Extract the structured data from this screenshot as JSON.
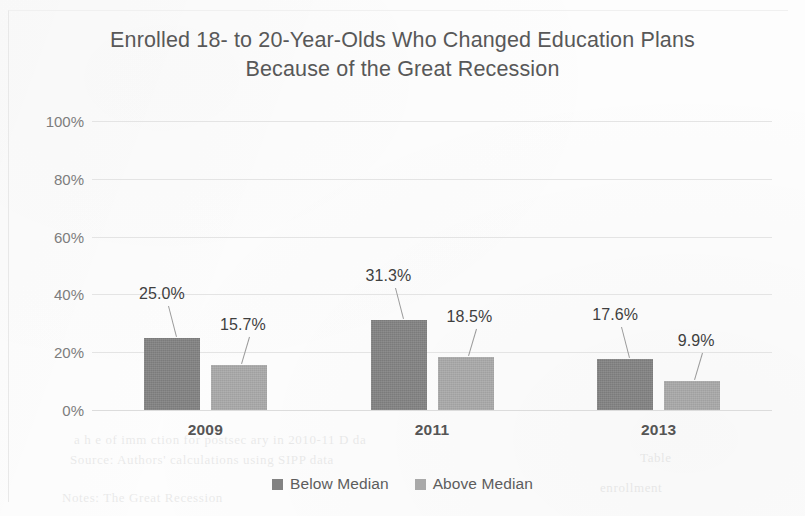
{
  "chart_data": {
    "type": "bar",
    "title": "Enrolled 18- to 20-Year-Olds Who Changed Education Plans Because of the Great Recession",
    "title_line1": "Enrolled 18- to 20-Year-Olds Who Changed Education Plans",
    "title_line2": "Because of the Great Recession",
    "xlabel": "",
    "ylabel": "",
    "categories": [
      "2009",
      "2011",
      "2013"
    ],
    "series": [
      {
        "name": "Below Median",
        "color": "#828282",
        "values": [
          25.0,
          31.3,
          17.6
        ],
        "labels": [
          "25.0%",
          "31.3%",
          "17.6%"
        ]
      },
      {
        "name": "Above Median",
        "color": "#a9a9a9",
        "values": [
          15.7,
          18.5,
          9.9
        ],
        "labels": [
          "15.7%",
          "18.5%",
          "9.9%"
        ]
      }
    ],
    "ylim": [
      0,
      100
    ],
    "ytick_values": [
      0,
      20,
      40,
      60,
      80,
      100
    ],
    "ytick_labels": [
      "0%",
      "20%",
      "40%",
      "60%",
      "80%",
      "100%"
    ],
    "grid": true,
    "grid_color": "#e4e4e4",
    "legend_position": "bottom-center",
    "data_labels_shown": true,
    "data_label_style": "callout-with-leader-line"
  },
  "background_ghost_text": [
    {
      "text": "a  h  e  of  imm  ction  for  postsec  ary  in  2010-11  D  da",
      "x": 74,
      "y": 432,
      "size": 13
    },
    {
      "text": "Source:  Authors'  calculations  using  SIPP  data",
      "x": 70,
      "y": 452,
      "size": 13
    },
    {
      "text": "Notes:  The  Great  Recession",
      "x": 62,
      "y": 490,
      "size": 13
    },
    {
      "text": "enrollment",
      "x": 600,
      "y": 480,
      "size": 13
    },
    {
      "text": "Table",
      "x": 640,
      "y": 450,
      "size": 13
    }
  ]
}
